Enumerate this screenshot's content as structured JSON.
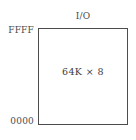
{
  "diagram": {
    "top_label": "I/O",
    "capacity": "64K × 8",
    "address_top": "FFFF",
    "address_bottom": "0000",
    "colors": {
      "background": "#ffffff",
      "border": "#4d4d4d",
      "text": "#3a3a3a"
    }
  },
  "chart_data": {
    "type": "diagram",
    "subtype": "memory-map",
    "regions": [
      {
        "label": "64K × 8",
        "address_low": "0000",
        "address_high": "FFFF",
        "annotation_top": "I/O"
      }
    ],
    "axis_labels": [
      "0000",
      "FFFF"
    ],
    "annotations": [
      "I/O",
      "64K × 8"
    ]
  }
}
